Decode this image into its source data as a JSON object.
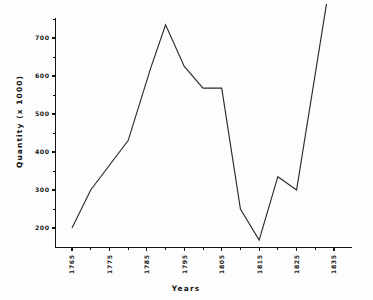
{
  "chart_data": {
    "type": "line",
    "title": "",
    "xlabel": "Years",
    "ylabel": "Quantity (x 1000)",
    "xlim": [
      1763,
      1838
    ],
    "ylim": [
      150,
      800
    ],
    "grid": false,
    "legend": null,
    "x_tick_labels": [
      "1765",
      "1775",
      "1785",
      "1795",
      "1805",
      "1815",
      "1825",
      "1835"
    ],
    "x_tick_values": [
      1765,
      1775,
      1785,
      1795,
      1805,
      1815,
      1825,
      1835
    ],
    "x_minor_tick_values": [
      1770,
      1780,
      1790,
      1800,
      1810,
      1820,
      1830
    ],
    "y_tick_labels": [
      "200",
      "300",
      "400",
      "500",
      "600",
      "700"
    ],
    "y_tick_values": [
      200,
      300,
      400,
      500,
      600,
      700
    ],
    "y_minor_tick_values": [
      250,
      350,
      450,
      550,
      650,
      750
    ],
    "series": [
      {
        "name": "Quantity",
        "color": "#2b2b2b",
        "x": [
          1765,
          1770,
          1780,
          1786,
          1790,
          1795,
          1800,
          1805,
          1810,
          1815,
          1820,
          1825,
          1833
        ],
        "values": [
          200,
          300,
          430,
          620,
          735,
          625,
          568,
          568,
          250,
          168,
          335,
          300,
          790
        ]
      }
    ]
  },
  "axis": {
    "y_title": "Quantity (x 1000)",
    "x_title": "Years"
  }
}
